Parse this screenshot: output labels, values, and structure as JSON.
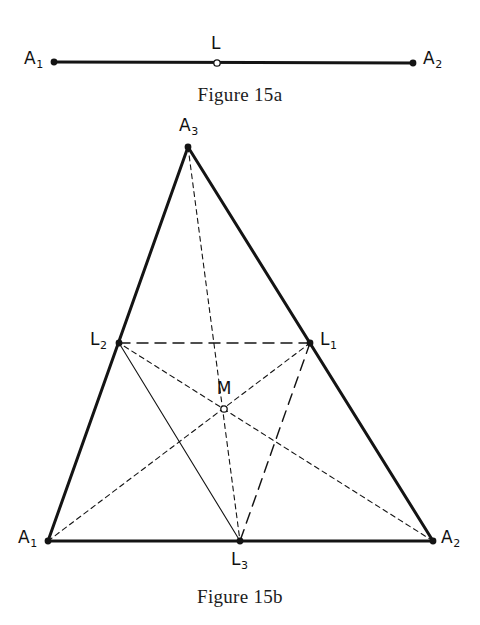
{
  "figure_a": {
    "caption": "Figure 15a",
    "points": [
      {
        "id": "A1",
        "label": "A",
        "sub": "1",
        "x": 54,
        "y": 62,
        "marker": "filled",
        "label_x": 24,
        "label_y": 50
      },
      {
        "id": "L",
        "label": "L",
        "sub": "",
        "x": 217,
        "y": 63,
        "marker": "open",
        "label_x": 211,
        "label_y": 35
      },
      {
        "id": "A2",
        "label": "A",
        "sub": "2",
        "x": 413,
        "y": 63,
        "marker": "filled",
        "label_x": 423,
        "label_y": 50
      }
    ],
    "segments": [
      {
        "from": "A1",
        "to": "A2",
        "style": "solid-thick"
      }
    ]
  },
  "figure_b": {
    "caption": "Figure 15b",
    "points": [
      {
        "id": "A3",
        "label": "A",
        "sub": "3",
        "x": 188,
        "y": 147,
        "marker": "filled",
        "label_x": 179,
        "label_y": 117
      },
      {
        "id": "L2",
        "label": "L",
        "sub": "2",
        "x": 119,
        "y": 343,
        "marker": "filled",
        "label_x": 90,
        "label_y": 331
      },
      {
        "id": "L1",
        "label": "L",
        "sub": "1",
        "x": 310,
        "y": 343,
        "marker": "filled",
        "label_x": 320,
        "label_y": 331
      },
      {
        "id": "M",
        "label": "M",
        "sub": "",
        "x": 224,
        "y": 409,
        "marker": "open",
        "label_x": 224,
        "label_y": 380
      },
      {
        "id": "A1",
        "label": "A",
        "sub": "1",
        "x": 48,
        "y": 541,
        "marker": "filled",
        "label_x": 18,
        "label_y": 529
      },
      {
        "id": "L3",
        "label": "L",
        "sub": "3",
        "x": 240,
        "y": 541,
        "marker": "filled",
        "label_x": 231,
        "label_y": 551
      },
      {
        "id": "A2",
        "label": "A",
        "sub": "2",
        "x": 433,
        "y": 541,
        "marker": "filled",
        "label_x": 441,
        "label_y": 529
      }
    ],
    "segments": [
      {
        "name": "side-A1-A3",
        "from": "A1",
        "to": "A3",
        "style": "solid-thick"
      },
      {
        "name": "side-A3-A2",
        "from": "A3",
        "to": "A2",
        "style": "solid-thick"
      },
      {
        "name": "side-A1-A2",
        "from": "A1",
        "to": "A2",
        "style": "solid-thick"
      },
      {
        "name": "midline-L2-L1",
        "from": "L2",
        "to": "L1",
        "style": "long-dash"
      },
      {
        "name": "midline-L1-L3",
        "from": "L1",
        "to": "L3",
        "style": "long-dash"
      },
      {
        "name": "midline-L2-L3",
        "from": "L2",
        "to": "L3",
        "style": "solid-thin"
      },
      {
        "name": "median-A3-L3",
        "from": "A3",
        "to": "L3",
        "style": "short-dash"
      },
      {
        "name": "median-A1-L1",
        "from": "A1",
        "to": "L1",
        "style": "short-dash"
      },
      {
        "name": "median-A2-L2",
        "from": "A2",
        "to": "L2",
        "style": "short-dash"
      }
    ]
  },
  "style": {
    "stroke_color": "#141414",
    "thick_width": 3.0,
    "thin_width": 1.1,
    "dash_long": "11 7",
    "dash_short": "5 4",
    "marker_radius_filled": 3.4,
    "marker_radius_open": 3.2
  }
}
